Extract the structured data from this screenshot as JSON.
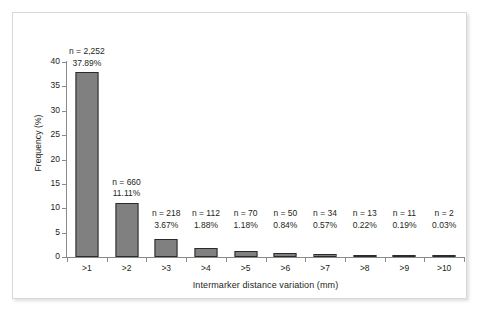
{
  "chart_data": {
    "type": "bar",
    "title": "",
    "xlabel": "Intermarker distance variation (mm)",
    "ylabel": "Frequency (%)",
    "categories": [
      ">1",
      ">2",
      ">3",
      ">4",
      ">5",
      ">6",
      ">7",
      ">8",
      ">9",
      ">10"
    ],
    "values": [
      37.89,
      11.11,
      3.67,
      1.88,
      1.18,
      0.84,
      0.57,
      0.22,
      0.19,
      0.03
    ],
    "counts": [
      2252,
      660,
      218,
      112,
      70,
      50,
      34,
      13,
      11,
      2
    ],
    "count_labels": [
      "n = 2,252",
      "n = 660",
      "n = 218",
      "n = 112",
      "n = 70",
      "n = 50",
      "n = 34",
      "n = 13",
      "n = 11",
      "n = 2"
    ],
    "percent_labels": [
      "37.89%",
      "11.11%",
      "3.67%",
      "1.88%",
      "1.18%",
      "0.84%",
      "0.57%",
      "0.22%",
      "0.19%",
      "0.03%"
    ],
    "ylim": [
      0,
      40
    ],
    "y_ticks": [
      0,
      5,
      10,
      15,
      20,
      25,
      30,
      35,
      40
    ],
    "y_tick_labels": [
      "0",
      "5",
      "10",
      "15",
      "20",
      "25",
      "30",
      "35",
      "40"
    ],
    "grid": false,
    "legend": false,
    "legend_position": "none",
    "bar_color": "#808080",
    "bar_border_color": "#2b2b2b",
    "axis_color": "#8a8a8a",
    "text_color": "#231f20",
    "background_color": "#ffffff",
    "frame_color": "#d9d9d9"
  }
}
